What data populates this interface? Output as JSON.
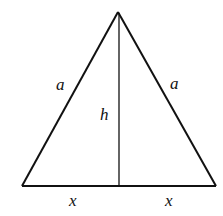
{
  "figure": {
    "stroke_color": "#111111",
    "background": "#ffffff"
  },
  "vertices": {
    "apex": [
      118,
      12
    ],
    "bottom_left": [
      22,
      186
    ],
    "bottom_right": [
      216,
      186
    ],
    "foot": [
      119,
      186
    ]
  },
  "labels": {
    "left_side": "a",
    "right_side": "a",
    "height": "h",
    "left_base": "x",
    "right_base": "x"
  }
}
